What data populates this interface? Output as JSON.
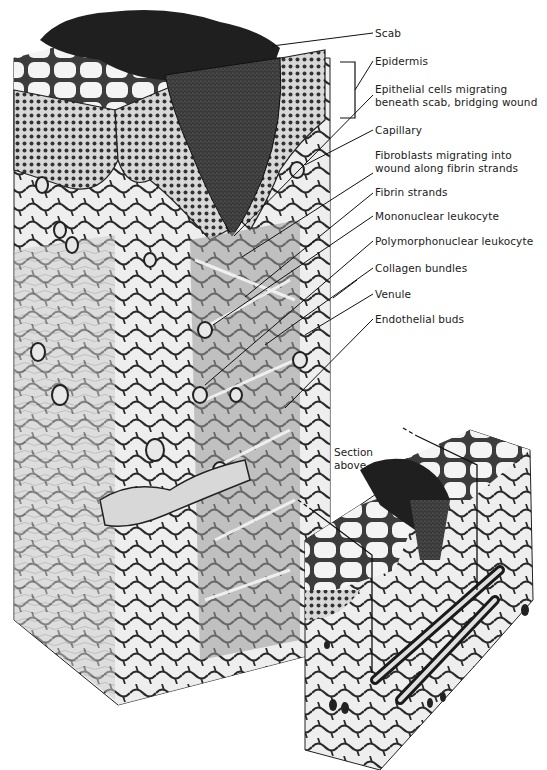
{
  "figure": {
    "main_block": {
      "description": "Cutaway 3D block of skin showing healing wound beneath scab",
      "labels": [
        {
          "id": "scab",
          "lines": [
            "Scab"
          ]
        },
        {
          "id": "epidermis",
          "lines": [
            "Epidermis"
          ]
        },
        {
          "id": "epithelial-cells",
          "lines": [
            "Epithelial cells migrating",
            "beneath scab, bridging wound"
          ]
        },
        {
          "id": "capillary",
          "lines": [
            "Capillary"
          ]
        },
        {
          "id": "fibroblasts",
          "lines": [
            "Fibroblasts migrating into",
            "wound along fibrin strands"
          ]
        },
        {
          "id": "fibrin-strands",
          "lines": [
            "Fibrin strands"
          ]
        },
        {
          "id": "mononuclear-leukocyte",
          "lines": [
            "Mononuclear leukocyte"
          ]
        },
        {
          "id": "polymorphonuclear-leukocyte",
          "lines": [
            "Polymorphonuclear leukocyte"
          ]
        },
        {
          "id": "collagen-bundles",
          "lines": [
            "Collagen bundles"
          ]
        },
        {
          "id": "venule",
          "lines": [
            "Venule"
          ]
        },
        {
          "id": "endothelial-buds",
          "lines": [
            "Endothelial buds"
          ]
        }
      ]
    },
    "inset_block": {
      "description": "Smaller block showing location of section plane",
      "label_lines": [
        "Section",
        "above"
      ]
    },
    "colors": {
      "ink": "#1a1a1a",
      "scab": "#2a2a2a",
      "tissue_light": "#f2f2f2",
      "tissue_mid": "#bdbdbd",
      "tissue_dark": "#5a5a5a",
      "background": "#ffffff"
    }
  }
}
